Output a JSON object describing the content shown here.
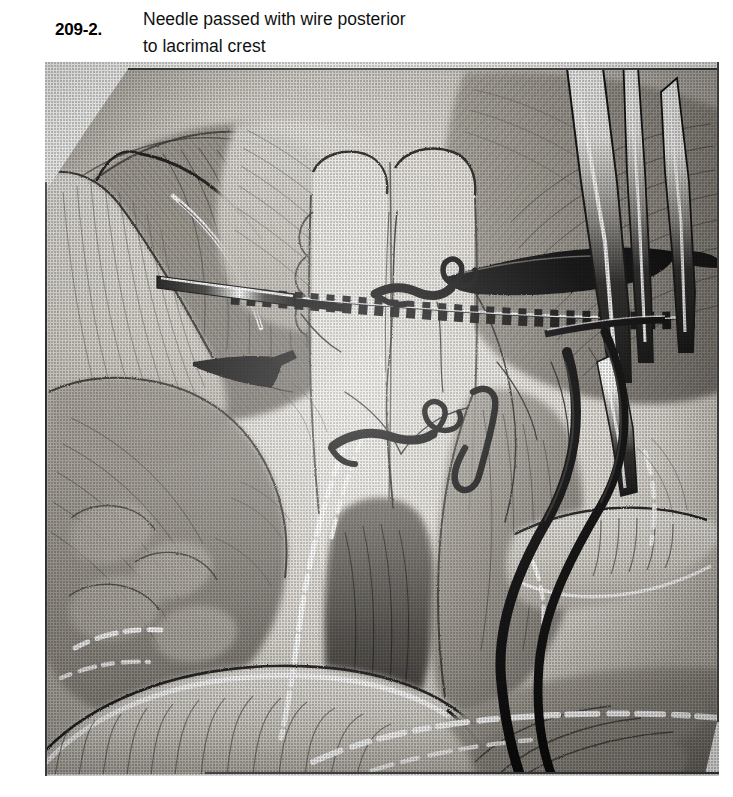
{
  "figure": {
    "number": "209-2.",
    "caption_line1": "Needle passed with wire posterior",
    "caption_line2": "to lacrimal crest",
    "caption_full": "Needle passed with wire posterior to lacrimal crest"
  },
  "illustration": {
    "kind": "surgical-anatomy-line-drawing",
    "subject": "Dacryocystorhinostomy / medial canthal region with needle and wire passed posterior to the lacrimal crest",
    "style": "pen-and-ink halftone stipple, black and white",
    "palette": {
      "ink": "#1b1b1b",
      "tissue_light": "#d9d6cf",
      "tissue_mid": "#9a968f",
      "tissue_dark": "#4f4c48",
      "highlight": "#ffffff",
      "paper": "#fbfbfa"
    },
    "elements": [
      {
        "name": "nasal-septum-midline",
        "description": "pale vertical midline column of nasal septum at center of field"
      },
      {
        "name": "wire-band",
        "description": "horizontal beaded / dashed black wire crossing the field left to right"
      },
      {
        "name": "needle-left",
        "description": "dark needle shaft entering from the left with white highlight"
      },
      {
        "name": "needle-right",
        "description": "dark needle tip angled from upper right"
      },
      {
        "name": "forceps",
        "description": "long two-pronged forceps entering from the top right corner"
      },
      {
        "name": "suture-knot-upper",
        "description": "black looped suture knot above the wire band"
      },
      {
        "name": "suture-knot-lower",
        "description": "black looped suture knot below the wire band"
      },
      {
        "name": "suture-loop-small",
        "description": "small black suture loop right of the midline"
      },
      {
        "name": "wire-strand-outer",
        "description": "thick black wire strand curving down the right side"
      },
      {
        "name": "wire-strand-inner",
        "description": "second black wire strand curving down the right side"
      },
      {
        "name": "tissue-flap-left",
        "description": "retracted tissue flap at the upper left"
      },
      {
        "name": "tissue-flap-lower",
        "description": "large retracted flap across the lower field"
      },
      {
        "name": "mucosa-folds",
        "description": "folded mucosal surfaces with white highlight dashes at the bottom"
      },
      {
        "name": "highlight-dashes",
        "description": "broken white highlight line marking cut mucosal edges"
      }
    ]
  }
}
